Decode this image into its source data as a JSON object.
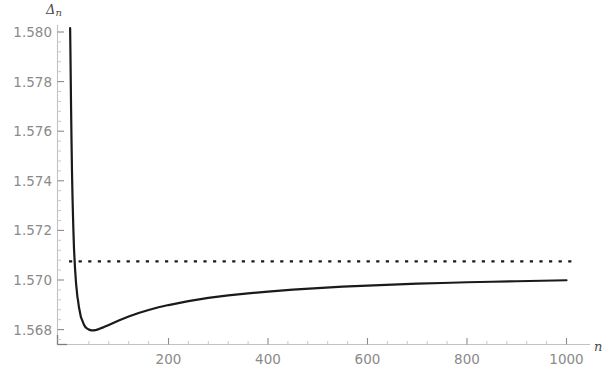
{
  "chart_data": {
    "type": "line",
    "title": "",
    "xlabel": "n",
    "ylabel": "Δn",
    "xlim": [
      0,
      1010
    ],
    "ylim": [
      1.5668,
      1.5803
    ],
    "grid": false,
    "legend": null,
    "xticks": [
      200,
      400,
      600,
      800,
      1000
    ],
    "xtick_labels": [
      "200",
      "400",
      "600",
      "800",
      "1000"
    ],
    "yticks": [
      1.568,
      1.57,
      1.572,
      1.574,
      1.576,
      1.578,
      1.58
    ],
    "ytick_labels": [
      "1.568",
      "1.570",
      "1.572",
      "1.574",
      "1.576",
      "1.578",
      "1.580"
    ],
    "series": [
      {
        "name": "Delta_n",
        "style": "solid",
        "color": "#1a1a1a",
        "width": 2.2,
        "x": [
          2,
          3,
          4,
          5,
          6,
          7,
          8,
          9,
          10,
          11,
          12,
          13,
          14,
          15,
          16,
          17,
          18,
          20,
          22,
          24,
          26,
          28,
          30,
          33,
          36,
          40,
          45,
          50,
          55,
          60,
          70,
          80,
          90,
          100,
          120,
          140,
          160,
          180,
          200,
          240,
          280,
          320,
          360,
          400,
          450,
          500,
          550,
          600,
          650,
          700,
          750,
          800,
          850,
          900,
          950,
          1000
        ],
        "y": [
          1.5806,
          1.579,
          1.5772,
          1.5757,
          1.5744,
          1.5734,
          1.5726,
          1.5719,
          1.5713,
          1.5709,
          1.5705,
          1.5702,
          1.5699,
          1.5697,
          1.5695,
          1.5693,
          1.5692,
          1.5689,
          1.5687,
          1.5685,
          1.5684,
          1.5683,
          1.5682,
          1.5681,
          1.56805,
          1.568,
          1.56797,
          1.56797,
          1.56799,
          1.56802,
          1.5681,
          1.56819,
          1.56828,
          1.56837,
          1.56853,
          1.56867,
          1.56879,
          1.5689,
          1.56899,
          1.56915,
          1.56928,
          1.56938,
          1.56946,
          1.56953,
          1.56961,
          1.56967,
          1.56973,
          1.56977,
          1.56981,
          1.56985,
          1.56988,
          1.56991,
          1.56993,
          1.56995,
          1.56997,
          1.56999
        ]
      },
      {
        "name": "asymptote",
        "style": "dotted",
        "color": "#1a1a1a",
        "width": 2.2,
        "constant_y": 1.57075,
        "x_start": 0,
        "x_end": 1010
      }
    ]
  },
  "labels": {
    "y_axis_symbol": "Δ",
    "y_axis_subscript": "n",
    "x_axis_symbol": "n"
  },
  "colors": {
    "curve": "#1a1a1a",
    "dotted": "#1a1a1a",
    "axis": "#b8b8b8",
    "axis_dark": "#8a8a8a",
    "tick_text": "#8a8a8a",
    "background": "#ffffff"
  }
}
